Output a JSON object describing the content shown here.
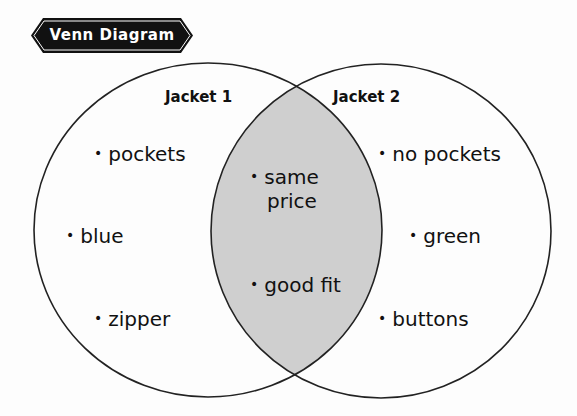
{
  "title": "Venn Diagram",
  "colors": {
    "outline": "#222222",
    "overlap_fill": "#cfcfcf",
    "banner_bg": "#111111",
    "banner_text": "#ffffff"
  },
  "sets": [
    {
      "label": "Jacket 1",
      "items": [
        "pockets",
        "blue",
        "zipper"
      ]
    },
    {
      "label": "Jacket 2",
      "items": [
        "no pockets",
        "green",
        "buttons"
      ]
    }
  ],
  "overlap": {
    "items": [
      "same price",
      "good fit"
    ],
    "item_lines": [
      [
        "same",
        "price"
      ],
      [
        "good fit"
      ]
    ]
  },
  "bullet": "•"
}
